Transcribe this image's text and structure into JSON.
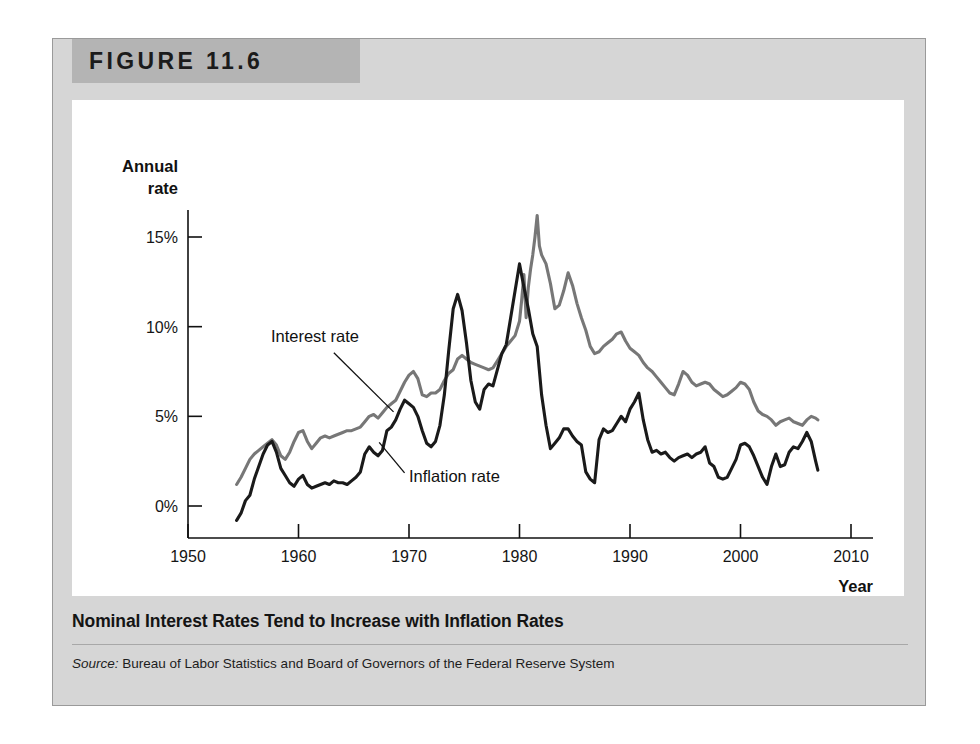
{
  "figure": {
    "number_label": "FIGURE 11.6",
    "caption": "Nominal Interest Rates Tend to Increase with Inflation Rates",
    "source_word": "Source:",
    "source_text": " Bureau of Labor Statistics and Board of Governors of the Federal Reserve System"
  },
  "colors": {
    "panel_background": "#d6d6d6",
    "band_background": "#b4b4b4",
    "card_background": "#ffffff",
    "interest_rate_line": "#777777",
    "inflation_rate_line": "#1a1a1a",
    "axis": "#111111",
    "text": "#141414"
  },
  "chart_data": {
    "type": "line",
    "title": "Nominal Interest Rates Tend to Increase with Inflation Rates",
    "xlabel": "Year",
    "ylabel": "Annual rate",
    "ylabel_line1": "Annual",
    "ylabel_line2": "rate",
    "grid": false,
    "legend": "annotations",
    "xlim": [
      1950,
      2010
    ],
    "ylim": [
      -2,
      17
    ],
    "xticks": [
      1950,
      1960,
      1970,
      1980,
      1990,
      2000,
      2010
    ],
    "xtick_labels": [
      "1950",
      "1960",
      "1970",
      "1980",
      "1990",
      "2000",
      "2010"
    ],
    "yticks": [
      0,
      5,
      10,
      15
    ],
    "ytick_labels": [
      "0%",
      "5%",
      "10%",
      "15%"
    ],
    "annotations": [
      {
        "label": "Interest rate",
        "text_x": 1957.5,
        "text_y": 9.15,
        "leader_from_x": 1963.2,
        "leader_from_y": 8.55,
        "leader_to_x": 1968.6,
        "leader_to_y": 5.25
      },
      {
        "label": "Inflation rate",
        "text_x": 1970.0,
        "text_y": 1.35,
        "leader_from_x": 1969.6,
        "leader_from_y": 1.85,
        "leader_to_x": 1967.3,
        "leader_to_y": 3.55
      }
    ],
    "series": [
      {
        "name": "Interest rate",
        "color": "#777777",
        "x": [
          1954.4,
          1954.8,
          1955.2,
          1955.6,
          1956.0,
          1956.4,
          1956.8,
          1957.2,
          1957.6,
          1958.0,
          1958.4,
          1958.8,
          1959.2,
          1959.6,
          1960.0,
          1960.4,
          1960.8,
          1961.2,
          1961.6,
          1962.0,
          1962.4,
          1962.8,
          1963.2,
          1963.6,
          1964.0,
          1964.4,
          1964.8,
          1965.2,
          1965.6,
          1966.0,
          1966.4,
          1966.8,
          1967.2,
          1967.6,
          1968.0,
          1968.4,
          1968.8,
          1969.2,
          1969.6,
          1970.0,
          1970.4,
          1970.8,
          1971.2,
          1971.6,
          1972.0,
          1972.4,
          1972.8,
          1973.2,
          1973.6,
          1974.0,
          1974.4,
          1974.8,
          1975.2,
          1975.6,
          1976.0,
          1976.4,
          1976.8,
          1977.2,
          1977.6,
          1978.0,
          1978.4,
          1978.8,
          1979.2,
          1979.6,
          1980.0,
          1980.2,
          1980.4,
          1980.6,
          1980.8,
          1981.0,
          1981.2,
          1981.4,
          1981.6,
          1981.8,
          1982.0,
          1982.4,
          1982.8,
          1983.2,
          1983.6,
          1984.0,
          1984.4,
          1984.8,
          1985.2,
          1985.6,
          1986.0,
          1986.4,
          1986.8,
          1987.2,
          1987.6,
          1988.0,
          1988.4,
          1988.8,
          1989.2,
          1989.6,
          1990.0,
          1990.4,
          1990.8,
          1991.2,
          1991.6,
          1992.0,
          1992.4,
          1992.8,
          1993.2,
          1993.6,
          1994.0,
          1994.4,
          1994.8,
          1995.2,
          1995.6,
          1996.0,
          1996.4,
          1996.8,
          1997.2,
          1997.6,
          1998.0,
          1998.4,
          1998.8,
          1999.2,
          1999.6,
          2000.0,
          2000.4,
          2000.8,
          2001.2,
          2001.6,
          2002.0,
          2002.4,
          2002.8,
          2003.2,
          2003.6,
          2004.0,
          2004.4,
          2004.8,
          2005.2,
          2005.6,
          2006.0,
          2006.4,
          2006.8,
          2007.0
        ],
        "y": [
          1.2,
          1.6,
          2.1,
          2.6,
          2.9,
          3.1,
          3.3,
          3.5,
          3.7,
          3.4,
          2.8,
          2.6,
          3.0,
          3.6,
          4.1,
          4.2,
          3.6,
          3.2,
          3.5,
          3.8,
          3.9,
          3.8,
          3.9,
          4.0,
          4.1,
          4.2,
          4.2,
          4.3,
          4.4,
          4.7,
          5.0,
          5.1,
          4.9,
          5.2,
          5.5,
          5.7,
          5.9,
          6.4,
          6.9,
          7.3,
          7.5,
          7.1,
          6.2,
          6.1,
          6.3,
          6.3,
          6.5,
          7.0,
          7.4,
          7.6,
          8.2,
          8.4,
          8.2,
          8.0,
          7.9,
          7.8,
          7.7,
          7.6,
          7.7,
          8.1,
          8.5,
          8.9,
          9.2,
          9.5,
          10.3,
          11.5,
          12.9,
          10.5,
          12.2,
          13.2,
          14.0,
          15.0,
          16.2,
          14.5,
          14.0,
          13.5,
          12.4,
          11.0,
          11.2,
          12.0,
          13.0,
          12.3,
          11.3,
          10.5,
          9.8,
          8.9,
          8.5,
          8.6,
          8.9,
          9.1,
          9.3,
          9.6,
          9.7,
          9.2,
          8.8,
          8.6,
          8.4,
          8.0,
          7.7,
          7.5,
          7.2,
          6.9,
          6.6,
          6.3,
          6.2,
          6.8,
          7.5,
          7.3,
          6.9,
          6.7,
          6.8,
          6.9,
          6.8,
          6.5,
          6.3,
          6.1,
          6.2,
          6.4,
          6.6,
          6.9,
          6.8,
          6.5,
          5.8,
          5.3,
          5.1,
          5.0,
          4.8,
          4.5,
          4.7,
          4.8,
          4.9,
          4.7,
          4.6,
          4.5,
          4.8,
          5.0,
          4.9,
          4.8
        ]
      },
      {
        "name": "Inflation rate",
        "color": "#1a1a1a",
        "x": [
          1954.4,
          1954.8,
          1955.2,
          1955.6,
          1956.0,
          1956.4,
          1956.8,
          1957.2,
          1957.6,
          1958.0,
          1958.4,
          1958.8,
          1959.2,
          1959.6,
          1960.0,
          1960.4,
          1960.8,
          1961.2,
          1961.6,
          1962.0,
          1962.4,
          1962.8,
          1963.2,
          1963.6,
          1964.0,
          1964.4,
          1964.8,
          1965.2,
          1965.6,
          1966.0,
          1966.4,
          1966.8,
          1967.2,
          1967.6,
          1968.0,
          1968.4,
          1968.8,
          1969.2,
          1969.6,
          1970.0,
          1970.4,
          1970.8,
          1971.2,
          1971.6,
          1972.0,
          1972.4,
          1972.8,
          1973.2,
          1973.6,
          1974.0,
          1974.4,
          1974.8,
          1975.2,
          1975.6,
          1976.0,
          1976.4,
          1976.8,
          1977.2,
          1977.6,
          1978.0,
          1978.4,
          1978.8,
          1979.2,
          1979.6,
          1980.0,
          1980.4,
          1980.8,
          1981.2,
          1981.6,
          1982.0,
          1982.4,
          1982.8,
          1983.2,
          1983.6,
          1984.0,
          1984.4,
          1984.8,
          1985.2,
          1985.6,
          1986.0,
          1986.4,
          1986.8,
          1987.2,
          1987.6,
          1988.0,
          1988.4,
          1988.8,
          1989.2,
          1989.6,
          1990.0,
          1990.4,
          1990.8,
          1991.2,
          1991.6,
          1992.0,
          1992.4,
          1992.8,
          1993.2,
          1993.6,
          1994.0,
          1994.4,
          1994.8,
          1995.2,
          1995.6,
          1996.0,
          1996.4,
          1996.8,
          1997.2,
          1997.6,
          1998.0,
          1998.4,
          1998.8,
          1999.2,
          1999.6,
          2000.0,
          2000.4,
          2000.8,
          2001.2,
          2001.6,
          2002.0,
          2002.4,
          2002.8,
          2003.2,
          2003.6,
          2004.0,
          2004.4,
          2004.8,
          2005.2,
          2005.6,
          2006.0,
          2006.4,
          2006.8,
          2007.0
        ],
        "y": [
          -0.8,
          -0.4,
          0.3,
          0.6,
          1.5,
          2.2,
          2.9,
          3.4,
          3.6,
          3.0,
          2.1,
          1.7,
          1.3,
          1.1,
          1.5,
          1.7,
          1.2,
          1.0,
          1.1,
          1.2,
          1.3,
          1.2,
          1.4,
          1.3,
          1.3,
          1.2,
          1.4,
          1.6,
          1.9,
          2.9,
          3.3,
          3.0,
          2.8,
          3.1,
          4.2,
          4.4,
          4.8,
          5.4,
          5.9,
          5.7,
          5.5,
          5.0,
          4.2,
          3.5,
          3.3,
          3.6,
          4.5,
          6.2,
          8.7,
          11.0,
          11.8,
          10.9,
          9.1,
          7.0,
          5.8,
          5.4,
          6.5,
          6.8,
          6.7,
          7.6,
          8.5,
          9.0,
          10.5,
          12.0,
          13.5,
          12.2,
          11.0,
          9.6,
          8.9,
          6.2,
          4.5,
          3.2,
          3.5,
          3.8,
          4.3,
          4.3,
          3.9,
          3.6,
          3.4,
          1.9,
          1.5,
          1.3,
          3.7,
          4.3,
          4.1,
          4.2,
          4.6,
          5.0,
          4.7,
          5.4,
          5.8,
          6.3,
          4.8,
          3.7,
          3.0,
          3.1,
          2.9,
          3.0,
          2.7,
          2.5,
          2.7,
          2.8,
          2.9,
          2.7,
          2.9,
          3.0,
          3.3,
          2.4,
          2.2,
          1.6,
          1.5,
          1.6,
          2.1,
          2.6,
          3.4,
          3.5,
          3.3,
          2.8,
          2.2,
          1.6,
          1.2,
          2.2,
          2.9,
          2.2,
          2.3,
          3.0,
          3.3,
          3.2,
          3.6,
          4.1,
          3.6,
          2.5,
          2.0
        ]
      }
    ]
  }
}
